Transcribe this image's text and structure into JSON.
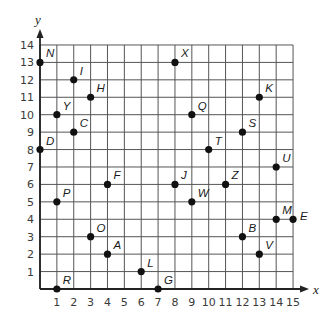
{
  "chart_data": {
    "type": "scatter",
    "title": "",
    "xlabel": "x",
    "ylabel": "y",
    "xlim": [
      0,
      15
    ],
    "ylim": [
      0,
      14
    ],
    "grid": true,
    "x_ticks": [
      1,
      2,
      3,
      4,
      5,
      6,
      7,
      8,
      9,
      10,
      11,
      12,
      13,
      14,
      15
    ],
    "y_ticks": [
      1,
      2,
      3,
      4,
      5,
      6,
      7,
      8,
      9,
      10,
      11,
      12,
      13,
      14
    ],
    "points": [
      {
        "label": "N",
        "x": 0,
        "y": 13
      },
      {
        "label": "I",
        "x": 2,
        "y": 12
      },
      {
        "label": "H",
        "x": 3,
        "y": 11
      },
      {
        "label": "Y",
        "x": 1,
        "y": 10
      },
      {
        "label": "C",
        "x": 2,
        "y": 9
      },
      {
        "label": "D",
        "x": 0,
        "y": 8
      },
      {
        "label": "F",
        "x": 4,
        "y": 6
      },
      {
        "label": "P",
        "x": 1,
        "y": 5
      },
      {
        "label": "O",
        "x": 3,
        "y": 3
      },
      {
        "label": "A",
        "x": 4,
        "y": 2
      },
      {
        "label": "L",
        "x": 6,
        "y": 1
      },
      {
        "label": "R",
        "x": 1,
        "y": 0
      },
      {
        "label": "G",
        "x": 7,
        "y": 0
      },
      {
        "label": "X",
        "x": 8,
        "y": 13
      },
      {
        "label": "K",
        "x": 13,
        "y": 11
      },
      {
        "label": "Q",
        "x": 9,
        "y": 10
      },
      {
        "label": "S",
        "x": 12,
        "y": 9
      },
      {
        "label": "T",
        "x": 10,
        "y": 8
      },
      {
        "label": "U",
        "x": 14,
        "y": 7
      },
      {
        "label": "J",
        "x": 8,
        "y": 6
      },
      {
        "label": "Z",
        "x": 11,
        "y": 6
      },
      {
        "label": "W",
        "x": 9,
        "y": 5
      },
      {
        "label": "M",
        "x": 14,
        "y": 4
      },
      {
        "label": "E",
        "x": 15,
        "y": 4
      },
      {
        "label": "B",
        "x": 12,
        "y": 3
      },
      {
        "label": "V",
        "x": 13,
        "y": 2
      }
    ]
  },
  "colors": {
    "grid": "#555555",
    "axis": "#222222",
    "point": "#111111"
  }
}
